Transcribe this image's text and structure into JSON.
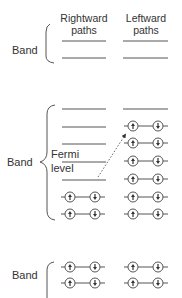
{
  "diagram": {
    "headers": {
      "rightward": [
        "Rightward",
        "paths"
      ],
      "leftward": [
        "Leftward",
        "paths"
      ]
    },
    "bands": [
      {
        "label": "Band",
        "bracket": "partial-left",
        "rightward_paths": [
          "empty",
          "empty"
        ],
        "leftward_paths": [
          "empty",
          "empty"
        ]
      },
      {
        "label": "Band",
        "bracket": "curly",
        "fermi_level_label": [
          "Fermi",
          "level"
        ],
        "rightward_paths": [
          "empty",
          "empty",
          "empty",
          "empty",
          "empty",
          "spin-pair",
          "spin-pair"
        ],
        "leftward_paths": [
          "empty",
          "spin-pair",
          "spin-pair",
          "spin-pair",
          "spin-pair",
          "spin-pair",
          "spin-pair"
        ],
        "transition_arrow": {
          "style": "dotted",
          "from": "rightward fermi level",
          "to": "leftward top filled path"
        }
      },
      {
        "label": "Band",
        "bracket": "partial-left",
        "rightward_paths": [
          "spin-pair",
          "spin-pair"
        ],
        "leftward_paths": [
          "spin-pair",
          "spin-pair"
        ]
      }
    ],
    "electron_glyphs": {
      "spin_up": "↑",
      "spin_down": "↓"
    },
    "colors": {
      "stroke": "#555555",
      "text": "#333333",
      "background": "#ffffff"
    }
  }
}
